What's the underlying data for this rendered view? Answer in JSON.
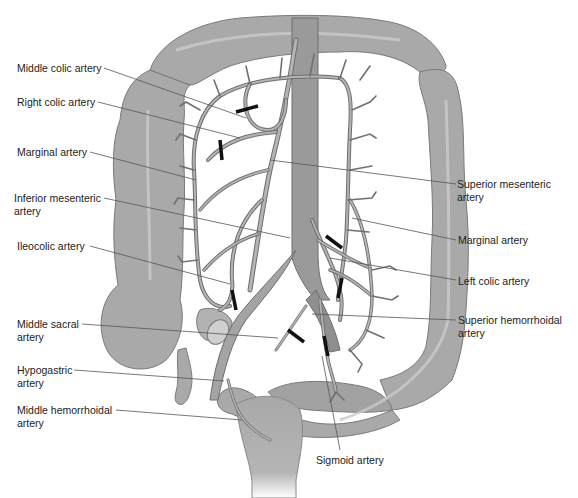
{
  "figure": {
    "colors": {
      "colon_fill": "#a9a9a9",
      "colon_edge": "#7a7a7a",
      "colon_highlight": "#c9c9c9",
      "artery_fill": "#b4b4b4",
      "artery_edge": "#6e6e6e",
      "aorta_fill": "#9a9a9a",
      "ligature": "#111111",
      "leader_line": "#555555",
      "label_text": "#222222"
    },
    "labels_left": [
      {
        "id": "middle-colic-artery",
        "text": "Middle colic artery"
      },
      {
        "id": "right-colic-artery",
        "text": "Right colic artery"
      },
      {
        "id": "marginal-artery-left",
        "text": "Marginal artery"
      },
      {
        "id": "inferior-mesenteric-artery",
        "text": "Inferior mesenteric\nartery"
      },
      {
        "id": "ileocolic-artery",
        "text": "Ileocolic artery"
      },
      {
        "id": "middle-sacral-artery",
        "text": "Middle sacral\nartery"
      },
      {
        "id": "hypogastric-artery",
        "text": "Hypogastric\nartery"
      },
      {
        "id": "middle-hemorrhoidal-artery",
        "text": "Middle hemorrhoidal\nartery"
      }
    ],
    "labels_right": [
      {
        "id": "superior-mesenteric-artery",
        "text": "Superior mesenteric\nartery"
      },
      {
        "id": "marginal-artery-right",
        "text": "Marginal artery"
      },
      {
        "id": "left-colic-artery",
        "text": "Left colic artery"
      },
      {
        "id": "superior-hemorrhoidal-artery",
        "text": "Superior hemorrhoidal\nartery"
      }
    ],
    "labels_bottom": [
      {
        "id": "sigmoid-artery",
        "text": "Sigmoid artery"
      }
    ],
    "ligature_count": 7
  }
}
